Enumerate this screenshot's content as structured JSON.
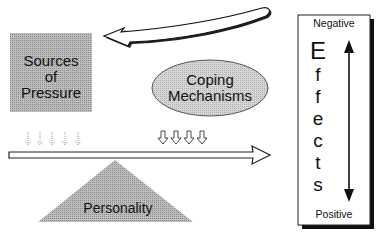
{
  "diagram": {
    "sources": {
      "line1": "Sources",
      "line2": "of",
      "line3": "Pressure"
    },
    "coping": {
      "line1": "Coping",
      "line2": "Mechanisms"
    },
    "personality": {
      "label": "Personality"
    },
    "effects": {
      "top": "Negative",
      "bottom": "Positive",
      "letters": [
        "E",
        "f",
        "f",
        "e",
        "c",
        "t",
        "s"
      ]
    },
    "colors": {
      "stipple": "#a9a9a9",
      "ellipse": "#cfcfcf",
      "outline": "#111111"
    }
  }
}
